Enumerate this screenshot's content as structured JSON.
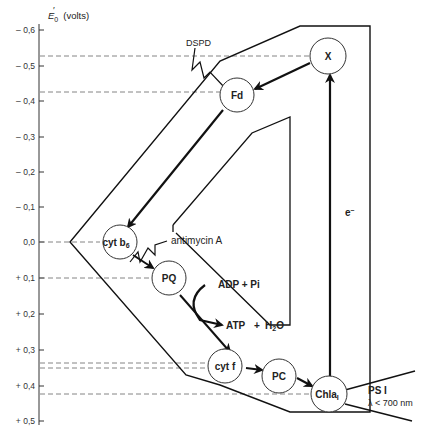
{
  "axis": {
    "title": "E′0 (volts)",
    "title_symbol": "E",
    "title_sub": "0",
    "title_unit": "(volts)",
    "ticks": [
      {
        "label": "– 0,6",
        "value": -0.6
      },
      {
        "label": "– 0,5",
        "value": -0.5
      },
      {
        "label": "– 0,4",
        "value": -0.4
      },
      {
        "label": "– 0,3",
        "value": -0.3
      },
      {
        "label": "– 0,2",
        "value": -0.2
      },
      {
        "label": "– 0,1",
        "value": -0.1
      },
      {
        "label": "0,0",
        "value": 0.0
      },
      {
        "label": "+ 0,1",
        "value": 0.1
      },
      {
        "label": "+ 0,2",
        "value": 0.2
      },
      {
        "label": "+ 0,3",
        "value": 0.3
      },
      {
        "label": "+ 0,4",
        "value": 0.4
      },
      {
        "label": "+ 0,5",
        "value": 0.5
      }
    ]
  },
  "nodes": {
    "x": {
      "label": "X",
      "potential": -0.53
    },
    "fd": {
      "label": "Fd",
      "potential": -0.43
    },
    "cytb6": {
      "label": "cyt b",
      "sub": "6",
      "potential": 0.0
    },
    "pq": {
      "label": "PQ",
      "potential": 0.1
    },
    "cytf": {
      "label": "cyt f",
      "potential": 0.35
    },
    "pc": {
      "label": "PC",
      "potential": 0.36
    },
    "chla1": {
      "label": "Chla",
      "sub": "I",
      "potential": 0.43
    }
  },
  "labels": {
    "dspd": "DSPD",
    "antimycin": "antimycin   A",
    "adp_pi": "ADP  +  Pi",
    "atp": "ATP",
    "plus": "+",
    "h2o_h": "H",
    "h2o_sub": "2",
    "h2o_o": "O",
    "electron": "e",
    "electron_sup": "–",
    "photosystem": "PS I",
    "wavelength": "λ < 700 nm"
  }
}
